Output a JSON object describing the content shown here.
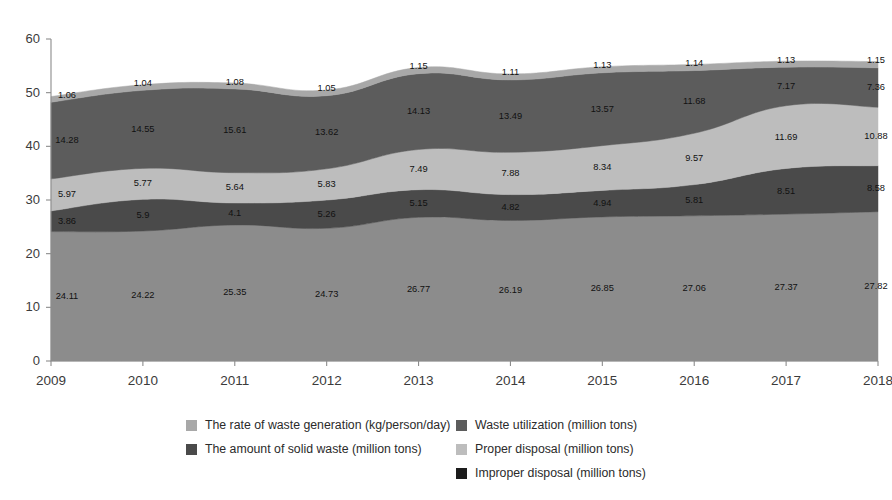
{
  "chart_data": {
    "type": "area",
    "title": "",
    "subtitle": "",
    "xlabel": "",
    "ylabel": "",
    "stacked": true,
    "grid": false,
    "legend_position": "bottom",
    "xlim": [
      "2009",
      "2018"
    ],
    "ylim": [
      0,
      60
    ],
    "yticks": [
      0,
      10,
      20,
      30,
      40,
      50,
      60
    ],
    "categories": [
      "2009",
      "2010",
      "2011",
      "2012",
      "2013",
      "2014",
      "2015",
      "2016",
      "2017",
      "2018"
    ],
    "x": [
      "2009",
      "2010",
      "2011",
      "2012",
      "2013",
      "2014",
      "2015",
      "2016",
      "2017",
      "2018"
    ],
    "series": [
      {
        "name": "The amount of solid waste (million tons)",
        "color": "#8c8c8c",
        "stack_order": 1,
        "values": [
          24.11,
          24.22,
          25.35,
          24.73,
          26.77,
          26.19,
          26.85,
          27.06,
          27.37,
          27.82
        ]
      },
      {
        "name": "Improper disposal (million tons)",
        "color": "#4a4a4a",
        "stack_order": 2,
        "values": [
          3.86,
          5.9,
          4.1,
          5.26,
          5.15,
          4.82,
          4.94,
          5.81,
          8.51,
          8.58
        ]
      },
      {
        "name": "Proper disposal (million tons)",
        "color": "#bdbdbd",
        "stack_order": 3,
        "values": [
          5.97,
          5.77,
          5.64,
          5.83,
          7.49,
          7.88,
          8.34,
          9.57,
          11.69,
          10.88
        ]
      },
      {
        "name": "Waste utilization (million tons)",
        "color": "#5c5c5c",
        "stack_order": 4,
        "values": [
          14.28,
          14.55,
          15.61,
          13.62,
          14.13,
          13.49,
          13.57,
          11.68,
          7.17,
          7.36
        ]
      },
      {
        "name": "The rate of waste generation (kg/person/day)",
        "color": "#a8a8a8",
        "stack_order": 5,
        "values": [
          1.06,
          1.04,
          1.08,
          1.05,
          1.15,
          1.11,
          1.13,
          1.14,
          1.13,
          1.15
        ]
      }
    ]
  },
  "axes": {
    "y_tick_labels": [
      "0",
      "10",
      "20",
      "30",
      "40",
      "50",
      "60"
    ],
    "x_tick_labels": [
      "2009",
      "2010",
      "2011",
      "2012",
      "2013",
      "2014",
      "2015",
      "2016",
      "2017",
      "2018"
    ]
  },
  "legend": {
    "columns": [
      {
        "items": [
          {
            "label": "The rate of waste generation (kg/person/day)",
            "color": "#a8a8a8",
            "swatch_name": "legend-swatch-waste-generation-rate"
          },
          {
            "label": "The amount of solid waste (million tons)",
            "color": "#4a4a4a",
            "swatch_name": "legend-swatch-solid-waste-amount"
          }
        ]
      },
      {
        "items": [
          {
            "label": "Waste utilization (million tons)",
            "color": "#5c5c5c",
            "swatch_name": "legend-swatch-waste-utilization"
          },
          {
            "label": "Proper disposal (million tons)",
            "color": "#bdbdbd",
            "swatch_name": "legend-swatch-proper-disposal"
          },
          {
            "label": "Improper disposal (million tons)",
            "color": "#1c1c1c",
            "swatch_name": "legend-swatch-improper-disposal"
          }
        ]
      }
    ]
  }
}
